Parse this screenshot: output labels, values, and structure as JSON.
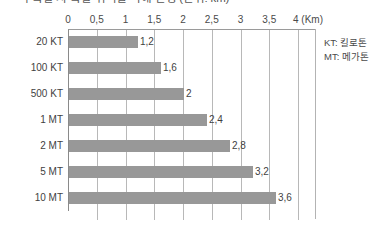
{
  "chart_data": {
    "type": "bar",
    "orientation": "horizontal",
    "title": "핵 폭발 시 폭발 위력별 피해 반경 (단위: km)",
    "categories": [
      "20 KT",
      "100 KT",
      "500 KT",
      "1 MT",
      "2 MT",
      "5 MT",
      "10 MT"
    ],
    "values": [
      1.2,
      1.6,
      2,
      2.4,
      2.8,
      3.2,
      3.6
    ],
    "value_labels": [
      "1,2",
      "1,6",
      "2",
      "2,4",
      "2,8",
      "3,2",
      "3,6"
    ],
    "xlabel": "",
    "ylabel": "",
    "xlim": [
      0,
      4
    ],
    "x_unit": "(Km)",
    "xticks": [
      0,
      0.5,
      1,
      1.5,
      2,
      2.5,
      3,
      3.5,
      4
    ],
    "xtick_labels": [
      "0",
      "0,5",
      "1",
      "1,5",
      "2",
      "2,5",
      "3",
      "3,5",
      "4"
    ],
    "grid": "vertical",
    "legend_position": "right-outside",
    "bar_color": "#989898",
    "gridline_color": "#b8b8b8",
    "axis_color": "#8a8a8a",
    "text_color": "#3f3f3f",
    "background": "#ffffff"
  },
  "legend": {
    "entries": [
      {
        "abbr": "KT",
        "text": "KT: 킬로톤"
      },
      {
        "abbr": "MT",
        "text": "MT: 메가톤"
      }
    ]
  }
}
